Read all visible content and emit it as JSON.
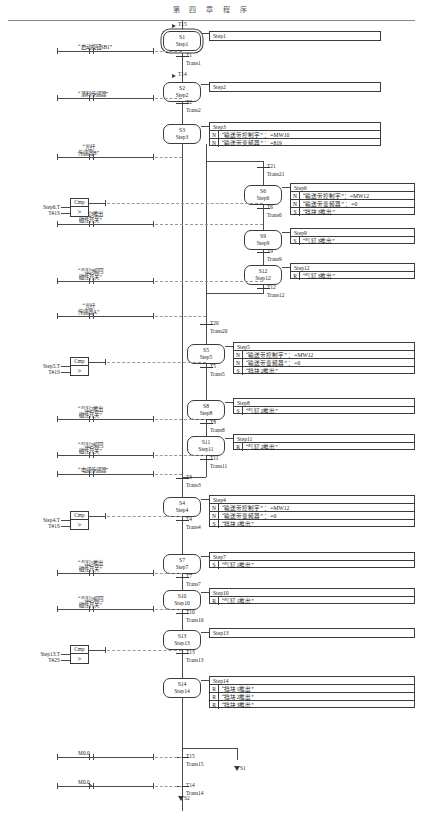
{
  "page": {
    "header": "第 四 章 程 序"
  },
  "steps": [
    {
      "id": "S1",
      "name": "Step1",
      "initial": true,
      "x": 163,
      "y": 31,
      "w": 38,
      "h": 20
    },
    {
      "id": "S2",
      "name": "Step2",
      "initial": false,
      "x": 163,
      "y": 82,
      "w": 38,
      "h": 20
    },
    {
      "id": "S3",
      "name": "Step3",
      "initial": false,
      "x": 163,
      "y": 124,
      "w": 38,
      "h": 20
    },
    {
      "id": "S6",
      "name": "Step6",
      "initial": false,
      "x": 244,
      "y": 185,
      "w": 38,
      "h": 20
    },
    {
      "id": "S9",
      "name": "Step9",
      "initial": false,
      "x": 244,
      "y": 230,
      "w": 38,
      "h": 20
    },
    {
      "id": "S12",
      "name": "Step12",
      "initial": false,
      "x": 244,
      "y": 265,
      "w": 38,
      "h": 20
    },
    {
      "id": "S5",
      "name": "Step5",
      "initial": false,
      "x": 187,
      "y": 344,
      "w": 38,
      "h": 20
    },
    {
      "id": "S8",
      "name": "Step8",
      "initial": false,
      "x": 187,
      "y": 400,
      "w": 38,
      "h": 20
    },
    {
      "id": "S11",
      "name": "Step11",
      "initial": false,
      "x": 187,
      "y": 436,
      "w": 38,
      "h": 20
    },
    {
      "id": "S4",
      "name": "Step4",
      "initial": false,
      "x": 163,
      "y": 497,
      "w": 38,
      "h": 20
    },
    {
      "id": "S7",
      "name": "Step7",
      "initial": false,
      "x": 163,
      "y": 554,
      "w": 38,
      "h": 20
    },
    {
      "id": "S10",
      "name": "Step10",
      "initial": false,
      "x": 163,
      "y": 590,
      "w": 38,
      "h": 20
    },
    {
      "id": "S13",
      "name": "Step13",
      "initial": false,
      "x": 163,
      "y": 630,
      "w": 38,
      "h": 20
    },
    {
      "id": "S14",
      "name": "Step14",
      "initial": false,
      "x": 163,
      "y": 678,
      "w": 38,
      "h": 20
    }
  ],
  "actions": [
    {
      "title": "Step1",
      "x": 209,
      "y": 31,
      "w": 172,
      "rows": []
    },
    {
      "title": "Step2",
      "x": 209,
      "y": 82,
      "w": 172,
      "rows": []
    },
    {
      "title": "Step3",
      "x": 209,
      "y": 122,
      "w": 172,
      "rows": [
        {
          "q": "N",
          "a": "“输送带控制字”  ：=MW10"
        },
        {
          "q": "N",
          "a": "“输送带变频器”  ：=819"
        }
      ]
    },
    {
      "title": "Step6",
      "x": 290,
      "y": 183,
      "w": 125,
      "rows": [
        {
          "q": "N",
          "a": "“输送带控制字”：=MW12"
        },
        {
          "q": "N",
          "a": "“输送带变频器”  ：=0"
        },
        {
          "q": "S",
          "a": "“挡块3推出”"
        }
      ]
    },
    {
      "title": "Step9",
      "x": 290,
      "y": 228,
      "w": 125,
      "rows": [
        {
          "q": "S",
          "a": "“气缸3推出”"
        }
      ]
    },
    {
      "title": "Step12",
      "x": 290,
      "y": 263,
      "w": 125,
      "rows": [
        {
          "q": "R",
          "a": "“气缸3推出”"
        }
      ]
    },
    {
      "title": "Step5",
      "x": 233,
      "y": 342,
      "w": 182,
      "rows": [
        {
          "q": "N",
          "a": "“输送带控制字”  ：=MW12"
        },
        {
          "q": "N",
          "a": "“输送带变频器”  ：=0"
        },
        {
          "q": "S",
          "a": "“挡块2推出”"
        }
      ]
    },
    {
      "title": "Step8",
      "x": 233,
      "y": 398,
      "w": 182,
      "rows": [
        {
          "q": "S",
          "a": "“气缸2推出”"
        }
      ]
    },
    {
      "title": "Step11",
      "x": 233,
      "y": 434,
      "w": 182,
      "rows": [
        {
          "q": "R",
          "a": "“气缸2推出”"
        }
      ]
    },
    {
      "title": "Step4",
      "x": 209,
      "y": 495,
      "w": 206,
      "rows": [
        {
          "q": "N",
          "a": "“输送带控制字”  ：=MW12"
        },
        {
          "q": "N",
          "a": "“输送带变频器”  ：=0"
        },
        {
          "q": "S",
          "a": "“挡块1推出”"
        }
      ]
    },
    {
      "title": "Step7",
      "x": 209,
      "y": 552,
      "w": 206,
      "rows": [
        {
          "q": "S",
          "a": "“气缸1推出”"
        }
      ]
    },
    {
      "title": "Step10",
      "x": 209,
      "y": 588,
      "w": 206,
      "rows": [
        {
          "q": "R",
          "a": "“气缸1推出”"
        }
      ]
    },
    {
      "title": "Step13",
      "x": 209,
      "y": 628,
      "w": 206,
      "rows": []
    },
    {
      "title": "Step14",
      "x": 209,
      "y": 676,
      "w": 206,
      "rows": [
        {
          "q": "R",
          "a": "“挡块1推出”"
        },
        {
          "q": "R",
          "a": "“挡块2推出”"
        },
        {
          "q": "R",
          "a": "“挡块3推出”"
        }
      ]
    }
  ],
  "transitions": [
    {
      "name": "T1",
      "trans": "Trans1",
      "x": 182,
      "y": 56
    },
    {
      "name": "T2",
      "trans": "Trans2",
      "x": 182,
      "y": 103
    },
    {
      "name": "T21",
      "trans": "Trans21",
      "x": 263,
      "y": 167
    },
    {
      "name": "T6",
      "trans": "Trans6",
      "x": 263,
      "y": 208
    },
    {
      "name": "T9",
      "trans": "Trans9",
      "x": 263,
      "y": 252
    },
    {
      "name": "T12",
      "trans": "Trans12",
      "x": 263,
      "y": 288
    },
    {
      "name": "T20",
      "trans": "Trans20",
      "x": 206,
      "y": 324
    },
    {
      "name": "T5",
      "trans": "Trans5",
      "x": 206,
      "y": 367
    },
    {
      "name": "T8",
      "trans": "Trans8",
      "x": 206,
      "y": 423
    },
    {
      "name": "T11",
      "trans": "Trans11",
      "x": 206,
      "y": 459
    },
    {
      "name": "T3",
      "trans": "Trans3",
      "x": 182,
      "y": 478
    },
    {
      "name": "T4",
      "trans": "Trans4",
      "x": 182,
      "y": 520
    },
    {
      "name": "T7",
      "trans": "Trans7",
      "x": 182,
      "y": 577
    },
    {
      "name": "T10",
      "trans": "Trans10",
      "x": 182,
      "y": 613
    },
    {
      "name": "T13",
      "trans": "Trans13",
      "x": 182,
      "y": 653
    },
    {
      "name": "T15",
      "trans": "Trans15",
      "x": 182,
      "y": 757
    },
    {
      "name": "T14",
      "trans": "Trans14",
      "x": 182,
      "y": 786
    }
  ],
  "jump_in": [
    {
      "label": "T15",
      "x": 172,
      "y": 24
    },
    {
      "label": "T14",
      "x": 172,
      "y": 74
    }
  ],
  "jump_out": [
    {
      "label": "S1",
      "x": 237,
      "y": 766
    },
    {
      "label": "S2",
      "x": 181,
      "y": 796
    }
  ],
  "contacts": [
    {
      "label": "“启动按钮SB1”",
      "x": 57,
      "y": 51,
      "w": 96,
      "type": "no"
    },
    {
      "label": "“落料传感器”",
      "x": 57,
      "y": 98,
      "w": 96,
      "type": "no"
    },
    {
      "label": "“光纤\n传感器B”",
      "x": 57,
      "y": 157,
      "w": 96,
      "type": "no"
    },
    {
      "label": "“气缸3推出\n磁性开关”",
      "x": 57,
      "y": 224,
      "w": 96,
      "type": "no"
    },
    {
      "label": "“气缸3缩回\n磁性开关”",
      "x": 57,
      "y": 281,
      "w": 96,
      "type": "no"
    },
    {
      "label": "“光纤\n传感器A”",
      "x": 57,
      "y": 316,
      "w": 96,
      "type": "no"
    },
    {
      "label": "“气缸2推出\n磁性开关”",
      "x": 57,
      "y": 419,
      "w": 96,
      "type": "no"
    },
    {
      "label": "“气缸2缩回\n磁性开关”",
      "x": 57,
      "y": 455,
      "w": 96,
      "type": "no"
    },
    {
      "label": "“电感传感器”",
      "x": 57,
      "y": 474,
      "w": 96,
      "type": "no"
    },
    {
      "label": "“气缸1推出\n磁性开关”",
      "x": 57,
      "y": 573,
      "w": 96,
      "type": "no"
    },
    {
      "label": "“气缸1缩回\n磁性开关”",
      "x": 57,
      "y": 609,
      "w": 96,
      "type": "no"
    },
    {
      "label": "M0.0",
      "x": 57,
      "y": 757,
      "w": 96,
      "type": "no"
    },
    {
      "label": "M0.0",
      "x": 57,
      "y": 786,
      "w": 96,
      "type": "nc"
    }
  ],
  "comparators": [
    {
      "head": "Cmp",
      "op": ">",
      "in1": "Step6.T",
      "in2": "T#1S",
      "x": 70,
      "y": 198
    },
    {
      "head": "Cmp",
      "op": ">",
      "in1": "Step5.T",
      "in2": "T#1S",
      "x": 70,
      "y": 357
    },
    {
      "head": "Cmp",
      "op": ">",
      "in1": "Step4.T",
      "in2": "T#1S",
      "x": 70,
      "y": 511
    },
    {
      "head": "Cmp",
      "op": ">",
      "in1": "Step13.T",
      "in2": "T#2S",
      "x": 70,
      "y": 645
    }
  ],
  "colors": {
    "line": "#3a3a3a",
    "dash": "#9a9a9a",
    "text": "#1a1a1a",
    "paper": "#ffffff"
  }
}
